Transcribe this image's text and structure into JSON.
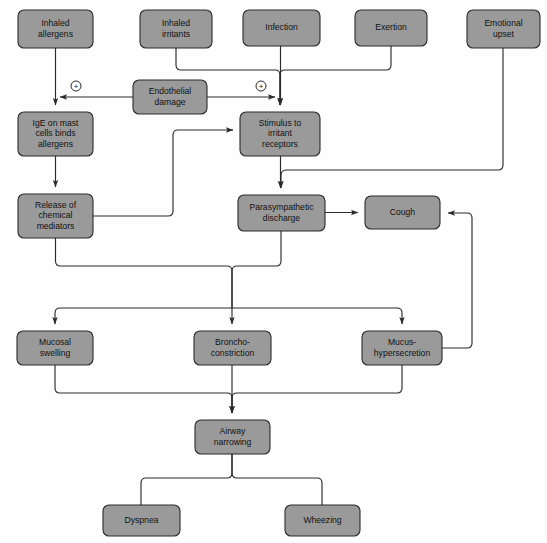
{
  "diagram": {
    "colors": {
      "node_fill": "#9a9a9a",
      "node_stroke": "#2a2a2a",
      "edge": "#2b2b2b",
      "background": "#fefefe",
      "label_text": "#111111"
    },
    "nodes": [
      {
        "id": "inhaled_allergens",
        "lines": [
          "Inhaled",
          "allergens"
        ],
        "x": 18,
        "y": 10,
        "w": 75,
        "h": 38
      },
      {
        "id": "inhaled_irritants",
        "lines": [
          "Inhaled",
          "irritants"
        ],
        "x": 140,
        "y": 10,
        "w": 72,
        "h": 38
      },
      {
        "id": "infection",
        "lines": [
          "Infection"
        ],
        "x": 243,
        "y": 10,
        "w": 77,
        "h": 36
      },
      {
        "id": "exertion",
        "lines": [
          "Exertion"
        ],
        "x": 355,
        "y": 10,
        "w": 72,
        "h": 36
      },
      {
        "id": "emotional_upset",
        "lines": [
          "Emotional",
          "upset"
        ],
        "x": 467,
        "y": 10,
        "w": 73,
        "h": 38
      },
      {
        "id": "endothelial_damage",
        "lines": [
          "Endothelial",
          "damage"
        ],
        "x": 133,
        "y": 80,
        "w": 74,
        "h": 34
      },
      {
        "id": "ige_mast_cells",
        "lines": [
          "IgE on mast",
          "cells binds",
          "allergens"
        ],
        "x": 18,
        "y": 112,
        "w": 75,
        "h": 44
      },
      {
        "id": "stimulus_irritant",
        "lines": [
          "Stimulus to",
          "irritant",
          "receptors"
        ],
        "x": 240,
        "y": 112,
        "w": 80,
        "h": 44
      },
      {
        "id": "release_mediators",
        "lines": [
          "Release of",
          "chemical",
          "mediators"
        ],
        "x": 18,
        "y": 194,
        "w": 75,
        "h": 44
      },
      {
        "id": "parasympathetic",
        "lines": [
          "Parasympathetic",
          "discharge"
        ],
        "x": 238,
        "y": 195,
        "w": 87,
        "h": 36
      },
      {
        "id": "cough",
        "lines": [
          "Cough"
        ],
        "x": 365,
        "y": 196,
        "w": 75,
        "h": 33
      },
      {
        "id": "mucosal_swelling",
        "lines": [
          "Mucosal",
          "swelling"
        ],
        "x": 17,
        "y": 331,
        "w": 76,
        "h": 34
      },
      {
        "id": "bronchoconstriction",
        "lines": [
          "Broncho-",
          "constriction"
        ],
        "x": 194,
        "y": 331,
        "w": 77,
        "h": 34
      },
      {
        "id": "mucus_hypersecretion",
        "lines": [
          "Mucus-",
          "hypersecretion"
        ],
        "x": 362,
        "y": 331,
        "w": 80,
        "h": 34
      },
      {
        "id": "airway_narrowing",
        "lines": [
          "Airway",
          "narrowing"
        ],
        "x": 195,
        "y": 420,
        "w": 75,
        "h": 34
      },
      {
        "id": "dyspnea",
        "lines": [
          "Dyspnea"
        ],
        "x": 103,
        "y": 505,
        "w": 77,
        "h": 31
      },
      {
        "id": "wheezing",
        "lines": [
          "Wheezing"
        ],
        "x": 285,
        "y": 505,
        "w": 75,
        "h": 31
      }
    ],
    "markers": [
      {
        "id": "plus_left",
        "glyph": "+",
        "cx": 76,
        "cy": 86,
        "r": 5
      },
      {
        "id": "plus_right",
        "glyph": "+",
        "cx": 261,
        "cy": 86,
        "r": 5
      }
    ],
    "edges": [
      {
        "id": "allergens-to-ige",
        "from": "inhaled_allergens",
        "to": "ige_mast_cells",
        "d": "M 55.5 48 L 55.5 105",
        "arrow": true
      },
      {
        "id": "irritants-to-stimulus",
        "from": "inhaled_irritants",
        "to": "stimulus_irritant",
        "d": "M 176 48 L 176 65 Q 176 70 181 70 L 275 70 Q 280 70 280 75 L 280 105",
        "arrow": true
      },
      {
        "id": "infection-to-stimulus",
        "from": "infection",
        "to": "stimulus_irritant",
        "d": "M 280.5 46 L 280.5 105",
        "arrow": true
      },
      {
        "id": "exertion-to-stimulus",
        "from": "exertion",
        "to": "stimulus_irritant",
        "d": "M 391 46 L 391 65 Q 391 70 386 70 L 285 70 Q 280 70 280 75 L 280 105",
        "arrow": true
      },
      {
        "id": "emotional-to-parasympathetic",
        "from": "emotional_upset",
        "to": "parasympathetic",
        "d": "M 503 48 L 503 165 Q 503 170 498 170 L 287 170 Q 281 170 281 175 L 281 188",
        "arrow": true
      },
      {
        "id": "endothelial-to-allergen-path",
        "from": "endothelial_damage",
        "to": "ige_mast_cells",
        "d": "M 133 97 L 60 97",
        "arrow": true
      },
      {
        "id": "endothelial-to-stimulus-path",
        "from": "endothelial_damage",
        "to": "stimulus_irritant",
        "d": "M 207 97 L 275 97",
        "arrow": true
      },
      {
        "id": "ige-to-release",
        "from": "ige_mast_cells",
        "to": "release_mediators",
        "d": "M 55.5 156 L 55.5 187",
        "arrow": true
      },
      {
        "id": "release-to-stimulus",
        "from": "release_mediators",
        "to": "stimulus_irritant",
        "d": "M 93 216 L 168 216 Q 173 216 173 211 L 173 135 Q 173 130 178 130 L 233 130",
        "arrow": true
      },
      {
        "id": "stimulus-to-parasympathetic",
        "from": "stimulus_irritant",
        "to": "parasympathetic",
        "d": "M 280.5 156 L 280.5 188",
        "arrow": true
      },
      {
        "id": "parasympathetic-to-cough",
        "from": "parasympathetic",
        "to": "cough",
        "d": "M 325 212.5 L 358 212.5",
        "arrow": true
      },
      {
        "id": "mucus-to-cough-feedback",
        "from": "mucus_hypersecretion",
        "to": "cough",
        "d": "M 442 348 L 467 348 Q 472 348 472 343 L 472 218 Q 472 213 467 213 L 448 213",
        "arrow": true
      },
      {
        "id": "release-down-merge",
        "from": "release_mediators",
        "to": "merge_bar",
        "d": "M 55.5 238 L 55.5 261 Q 55.5 266 60.5 266 L 227 266 Q 232 266 232 271 L 232 308",
        "arrow": false
      },
      {
        "id": "parasympathetic-down-merge",
        "from": "parasympathetic",
        "to": "merge_bar",
        "d": "M 281 231 L 281 261 Q 281 266 276 266 L 237 266 Q 232 266 232 271 L 232 308",
        "arrow": false
      },
      {
        "id": "merge-to-mucosal",
        "from": "merge_bar",
        "to": "mucosal_swelling",
        "d": "M 232 308 L 60 308 Q 55 308 55 313 L 55 324",
        "arrow": true
      },
      {
        "id": "merge-to-bronchoconstriction",
        "from": "merge_bar",
        "to": "bronchoconstriction",
        "d": "M 232 308 L 232 324",
        "arrow": true
      },
      {
        "id": "merge-to-mucus",
        "from": "merge_bar",
        "to": "mucus_hypersecretion",
        "d": "M 232 308 L 397 308 Q 402 308 402 313 L 402 324",
        "arrow": true
      },
      {
        "id": "mucosal-to-airway",
        "from": "mucosal_swelling",
        "to": "airway_narrowing",
        "d": "M 55 365 L 55 388 Q 55 393 60 393 L 227 393 Q 232 393 232 398 L 232 413",
        "arrow": true
      },
      {
        "id": "broncho-to-airway",
        "from": "bronchoconstriction",
        "to": "airway_narrowing",
        "d": "M 232 365 L 232 413",
        "arrow": true
      },
      {
        "id": "mucus-to-airway",
        "from": "mucus_hypersecretion",
        "to": "airway_narrowing",
        "d": "M 402 365 L 402 388 Q 402 393 397 393 L 237 393 Q 232 393 232 398 L 232 413",
        "arrow": true
      },
      {
        "id": "airway-to-dyspnea",
        "from": "airway_narrowing",
        "to": "dyspnea",
        "d": "M 232 454 L 232 473 Q 232 478 227 478 L 146 478 Q 141 478 141 483 L 141 505",
        "arrow": false
      },
      {
        "id": "airway-to-wheezing",
        "from": "airway_narrowing",
        "to": "wheezing",
        "d": "M 232 454 L 232 473 Q 232 478 237 478 L 317 478 Q 322 478 322 483 L 322 505",
        "arrow": false
      }
    ]
  }
}
